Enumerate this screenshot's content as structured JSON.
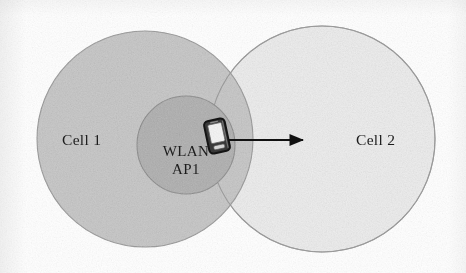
{
  "figure": {
    "width": 466,
    "height": 273,
    "background_color": "#ffffff",
    "kind": "network-coverage-diagram"
  },
  "labels": {
    "cell1": "Cell 1",
    "cell2": "Cell 2",
    "ap_line1": "WLAN",
    "ap_line2": "AP1"
  },
  "shapes": {
    "cell1_circle": {
      "name": "Cell 1 coverage area",
      "cx": 145,
      "cy": 139,
      "r": 108,
      "fill": "#c9c9c9",
      "stroke": "#9a9a9a"
    },
    "cell2_circle": {
      "name": "Cell 2 coverage area",
      "cx": 322,
      "cy": 139,
      "r": 113,
      "fill": "#efefef",
      "stroke": "#a8a8a8"
    },
    "wlan_circle": {
      "name": "WLAN AP1 coverage area",
      "cx": 186,
      "cy": 145,
      "r": 49,
      "fill": "#b2b2b2",
      "stroke": "#8d8d8d"
    },
    "arrow": {
      "name": "handover direction arrow",
      "x1": 228,
      "y1": 140,
      "x2": 310,
      "y2": 140,
      "color": "#111111",
      "direction": "right",
      "meaning": "device moves from Cell 1 toward Cell 2"
    },
    "device": {
      "name": "mobile handset",
      "x": 206,
      "y": 119,
      "width": 22,
      "height": 34,
      "body_color": "#2b2b2b",
      "screen_color": "#f2f2f2",
      "tilt_degrees": -12
    }
  }
}
